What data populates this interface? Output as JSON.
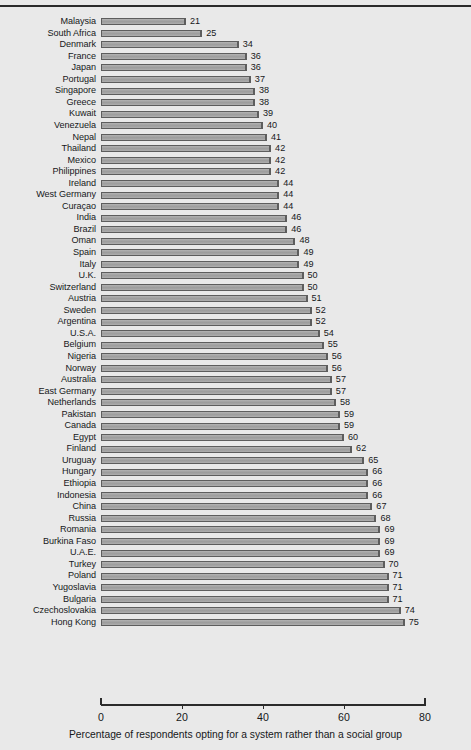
{
  "chart_data": {
    "type": "bar",
    "orientation": "horizontal",
    "title": "",
    "xlabel": "Percentage of respondents opting for a system rather than a social group",
    "ylabel": "",
    "xlim": [
      0,
      80
    ],
    "xticks": [
      0,
      20,
      40,
      60,
      80
    ],
    "xtick_labels": [
      "0",
      "20",
      "40",
      "60",
      "80"
    ],
    "grid": false,
    "legend": false,
    "bar_value_labels": true,
    "sorted": "ascending",
    "categories": [
      "Malaysia",
      "South Africa",
      "Denmark",
      "France",
      "Japan",
      "Portugal",
      "Singapore",
      "Greece",
      "Kuwait",
      "Venezuela",
      "Nepal",
      "Thailand",
      "Mexico",
      "Philippines",
      "Ireland",
      "West Germany",
      "Curaçao",
      "India",
      "Brazil",
      "Oman",
      "Spain",
      "Italy",
      "U.K.",
      "Switzerland",
      "Austria",
      "Sweden",
      "Argentina",
      "U.S.A.",
      "Belgium",
      "Nigeria",
      "Norway",
      "Australia",
      "East Germany",
      "Netherlands",
      "Pakistan",
      "Canada",
      "Egypt",
      "Finland",
      "Uruguay",
      "Hungary",
      "Ethiopia",
      "Indonesia",
      "China",
      "Russia",
      "Romania",
      "Burkina Faso",
      "U.A.E.",
      "Turkey",
      "Poland",
      "Yugoslavia",
      "Bulgaria",
      "Czechoslovakia",
      "Hong Kong"
    ],
    "values": [
      21,
      25,
      34,
      36,
      36,
      37,
      38,
      38,
      39,
      40,
      41,
      42,
      42,
      42,
      44,
      44,
      44,
      46,
      46,
      48,
      49,
      49,
      50,
      50,
      51,
      52,
      52,
      54,
      55,
      56,
      56,
      57,
      57,
      58,
      59,
      59,
      60,
      62,
      65,
      66,
      66,
      66,
      67,
      68,
      69,
      69,
      69,
      70,
      71,
      71,
      71,
      74,
      75
    ],
    "colors": {
      "background": "#e9e9e9",
      "bar_fill": "#a8a8a8",
      "bar_edge": "#5d5d5d",
      "axis": "#2b2b2b",
      "text": "#16181a"
    }
  }
}
